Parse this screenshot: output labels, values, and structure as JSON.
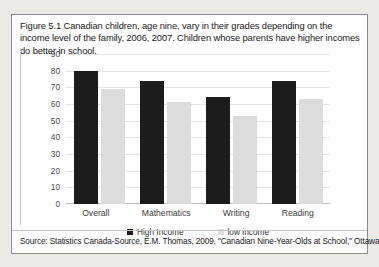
{
  "figure": {
    "caption": "Figure 5.1 Canadian children, age nine, vary in their grades depending on the income level of the family, 2006, 2007. Children whose parents have higher incomes do better in school.",
    "source": "Source: Statistics Canada-Source, E.M. Thomas, 2009, \"Canadian Nine-Year-Olds at School,\" Ottawa, Statistics Canada."
  },
  "colors": {
    "high_income_bar": "#1c1c1c",
    "low_income_bar": "#dcdcdc",
    "gridline": "#e3e3e3",
    "frame_border": "#8d8d8d",
    "page_background": "#eceae6",
    "figure_background": "#ffffff"
  },
  "chart_data": {
    "type": "bar",
    "title": "",
    "subtitle": "",
    "xlabel": "",
    "ylabel": "",
    "categories": [
      "Overall",
      "Mathematics",
      "Writing",
      "Reading"
    ],
    "series": [
      {
        "name": "High Income",
        "values": [
          80,
          74,
          64,
          74
        ]
      },
      {
        "name": "low income",
        "values": [
          69,
          61,
          53,
          63
        ]
      }
    ],
    "ylim": [
      0,
      90
    ],
    "yticks": [
      90,
      80,
      70,
      60,
      50,
      40,
      30,
      20,
      10,
      0
    ],
    "ytick_labels": [
      "90",
      "80",
      "70",
      "60",
      "50",
      "40",
      "30",
      "20",
      "10",
      "0"
    ],
    "grid": true,
    "legend_position": "bottom",
    "legend": [
      "High Income",
      "low income"
    ]
  }
}
